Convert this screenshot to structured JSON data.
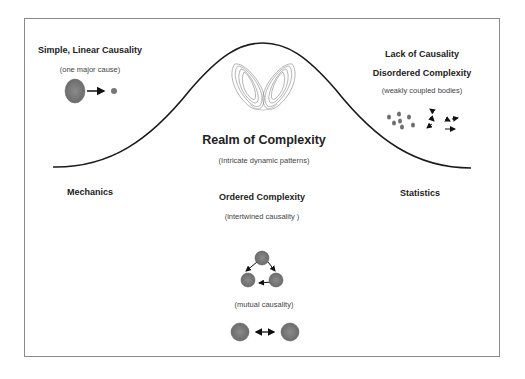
{
  "diagram": {
    "top_left": {
      "title": "Simple, Linear Causality",
      "subtitle": "(one major cause)"
    },
    "top_right": {
      "title1": "Lack of Causality",
      "title2": "Disordered Complexity",
      "subtitle": "(weakly coupled bodies)"
    },
    "center": {
      "title": "Realm of Complexity",
      "subtitle": "(Intricate dynamic patterns)"
    },
    "left_axis_label": "Mechanics",
    "right_axis_label": "Statistics",
    "ordered": {
      "title": "Ordered Complexity",
      "subtitle": "(intertwined causality )"
    },
    "mutual": {
      "subtitle": "(mutual causality)"
    },
    "colors": {
      "node_fill": "#7a7a7a",
      "curve": "#1a1a1a",
      "frame": "#8a8a8a"
    }
  }
}
